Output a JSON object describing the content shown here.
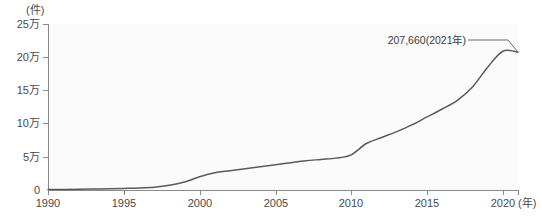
{
  "chart_data": {
    "type": "line",
    "title": "",
    "subtitle": "",
    "xlabel": "年",
    "ylabel": "件",
    "y_unit_label": "(件)",
    "x_unit_label": "(年)",
    "xlim": [
      1990,
      2021
    ],
    "ylim": [
      0,
      250000
    ],
    "grid": false,
    "legend": null,
    "y_ticks": [
      {
        "value": 250000,
        "label": "25万"
      },
      {
        "value": 200000,
        "label": "20万"
      },
      {
        "value": 150000,
        "label": "15万"
      },
      {
        "value": 100000,
        "label": "10万"
      },
      {
        "value": 50000,
        "label": "5万"
      },
      {
        "value": 0,
        "label": "0"
      }
    ],
    "x_ticks": [
      {
        "value": 1990,
        "label": "1990"
      },
      {
        "value": 1995,
        "label": "1995"
      },
      {
        "value": 2000,
        "label": "2000"
      },
      {
        "value": 2005,
        "label": "2005"
      },
      {
        "value": 2010,
        "label": "2010"
      },
      {
        "value": 2015,
        "label": "2015"
      },
      {
        "value": 2020,
        "label": "2020"
      }
    ],
    "x": [
      1990,
      1991,
      1992,
      1993,
      1994,
      1995,
      1996,
      1997,
      1998,
      1999,
      2000,
      2001,
      2002,
      2003,
      2004,
      2005,
      2006,
      2007,
      2008,
      2009,
      2010,
      2011,
      2012,
      2013,
      2014,
      2015,
      2016,
      2017,
      2018,
      2019,
      2020,
      2021
    ],
    "values": [
      700,
      900,
      1200,
      1500,
      1900,
      2400,
      3000,
      4200,
      7000,
      12000,
      20000,
      26000,
      29000,
      32000,
      35000,
      38000,
      41000,
      44000,
      46000,
      48000,
      53000,
      70000,
      79000,
      88000,
      98000,
      110000,
      122000,
      135000,
      155000,
      185000,
      209000,
      207660
    ],
    "annotations": [
      {
        "text": "207,660(2021年)",
        "point_x": 2021,
        "point_y": 207660
      }
    ]
  }
}
